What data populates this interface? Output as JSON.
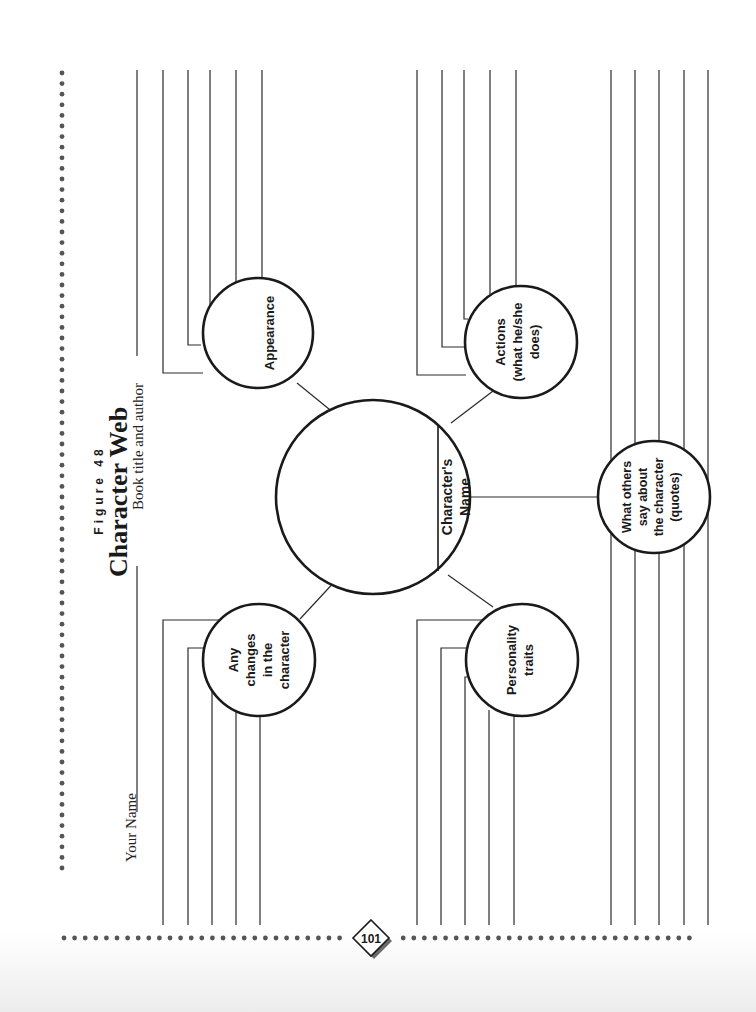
{
  "figure_label": "Figure 48",
  "title": "Character Web",
  "fields": {
    "book_title_label": "Book title and author",
    "your_name_label": "Your Name"
  },
  "center": {
    "label_line1": "Character's",
    "label_line2": "Name"
  },
  "bubbles": {
    "appearance": {
      "lines": [
        "Appearance"
      ]
    },
    "actions": {
      "lines": [
        "Actions",
        "(what he/she",
        "does)"
      ]
    },
    "changes": {
      "lines": [
        "Any",
        "changes",
        "in the",
        "character"
      ]
    },
    "personality": {
      "lines": [
        "Personality",
        "traits"
      ]
    },
    "others_say": {
      "lines": [
        "What others",
        "say about",
        "the character",
        "(quotes)"
      ]
    }
  },
  "page_number": "101",
  "colors": {
    "ink": "#1a1a1a",
    "dots": "#555555",
    "paper": "#ffffff"
  }
}
